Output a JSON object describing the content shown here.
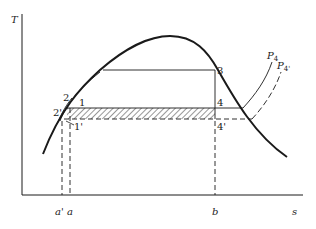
{
  "figure": {
    "type": "temperature-entropy diagram",
    "axes": {
      "y_label": "T",
      "x_label": "s",
      "x_ticks": [
        "a'",
        "a",
        "b"
      ]
    },
    "points": {
      "p1": "1",
      "p1_prime": "1'",
      "p2": "2",
      "p2_prime": "2'",
      "p3": "3",
      "p4": "4",
      "p4_prime": "4'"
    },
    "curves": {
      "isobar_p4": "P",
      "isobar_p4_sub": "4",
      "isobar_p4_prime": "P",
      "isobar_p4_prime_sub": "4'"
    },
    "colors": {
      "ink": "#1a1a1a",
      "background": "#ffffff"
    }
  }
}
